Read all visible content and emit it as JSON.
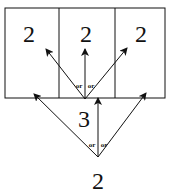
{
  "diagram": {
    "cells": [
      {
        "label": "2"
      },
      {
        "label": "2"
      },
      {
        "label": "2"
      }
    ],
    "middle_node": {
      "label": "3"
    },
    "bottom_node": {
      "label": "2"
    },
    "upper_or_labels": [
      "or",
      "or"
    ],
    "lower_or_labels": [
      "or",
      "or"
    ],
    "colors": {
      "line": "#111111",
      "background": "#ffffff"
    }
  }
}
